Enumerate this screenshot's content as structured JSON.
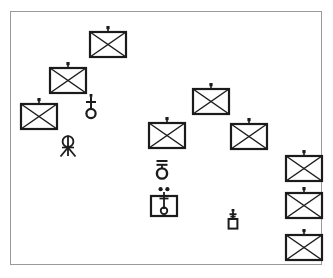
{
  "diagram": {
    "title": "Tactical Unit Disposition Overlay",
    "frame": {
      "x": 10,
      "y": 11,
      "width": 312,
      "height": 254,
      "border_color": "#9a9a9a",
      "background_color": "#ffffff"
    },
    "stroke_color": "#1b1b1b",
    "canvas_width": 333,
    "canvas_height": 278,
    "symbol_count": 15
  },
  "legend": {
    "infantry_unit": "Infantry unit (rectangle with saltire) with antenna mast",
    "antenna_post": "Antenna post with cross bar and ring base",
    "tripod_mast": "Tripod mounted loop antenna",
    "double_bar_ring": "Ring with double horizontal bar",
    "boxed_mast": "Boxed vertical mast with ring base and paired dots",
    "small_post": "Small boxed post with antenna"
  },
  "symbols": [
    {
      "id": "infantry-1",
      "kind": "infantry-unit",
      "label": "Infantry unit 1",
      "x": 87,
      "y": 25,
      "w": 36,
      "h": 26
    },
    {
      "id": "infantry-2",
      "kind": "infantry-unit",
      "label": "Infantry unit 2",
      "x": 47,
      "y": 61,
      "w": 36,
      "h": 26
    },
    {
      "id": "infantry-3",
      "kind": "infantry-unit",
      "label": "Infantry unit 3",
      "x": 18,
      "y": 97,
      "w": 36,
      "h": 26
    },
    {
      "id": "infantry-4",
      "kind": "infantry-unit",
      "label": "Infantry unit 4",
      "x": 190,
      "y": 82,
      "w": 36,
      "h": 26
    },
    {
      "id": "infantry-5",
      "kind": "infantry-unit",
      "label": "Infantry unit 5",
      "x": 146,
      "y": 116,
      "w": 36,
      "h": 26
    },
    {
      "id": "infantry-6",
      "kind": "infantry-unit",
      "label": "Infantry unit 6",
      "x": 228,
      "y": 117,
      "w": 36,
      "h": 26
    },
    {
      "id": "infantry-7",
      "kind": "infantry-unit",
      "label": "Infantry unit 7",
      "x": 283,
      "y": 149,
      "w": 36,
      "h": 26
    },
    {
      "id": "infantry-8",
      "kind": "infantry-unit",
      "label": "Infantry unit 8",
      "x": 283,
      "y": 186,
      "w": 36,
      "h": 26
    },
    {
      "id": "infantry-9",
      "kind": "infantry-unit",
      "label": "Infantry unit 9",
      "x": 283,
      "y": 228,
      "w": 36,
      "h": 26
    },
    {
      "id": "antenna-post-1",
      "kind": "antenna-post",
      "label": "Antenna post",
      "x": 82,
      "y": 93,
      "w": 16,
      "h": 26
    },
    {
      "id": "tripod-mast-1",
      "kind": "tripod-mast",
      "label": "Tripod loop antenna",
      "x": 56,
      "y": 134,
      "w": 20,
      "h": 24
    },
    {
      "id": "ring-bar-1",
      "kind": "double-bar-ring",
      "label": "Double bar ring",
      "x": 152,
      "y": 158,
      "w": 16,
      "h": 22
    },
    {
      "id": "boxed-mast-1",
      "kind": "boxed-mast",
      "label": "Boxed mast station",
      "x": 147,
      "y": 186,
      "w": 28,
      "h": 32
    },
    {
      "id": "small-post-1",
      "kind": "small-post",
      "label": "Small boxed post",
      "x": 224,
      "y": 208,
      "w": 14,
      "h": 22
    }
  ]
}
